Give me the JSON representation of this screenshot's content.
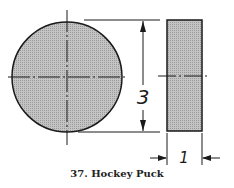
{
  "figure": {
    "caption": "37. Hockey Puck",
    "dimensions": {
      "diameter": "3",
      "thickness": "1"
    },
    "fill_color": "#b8b8b8",
    "line_color": "#1a1a1a"
  }
}
